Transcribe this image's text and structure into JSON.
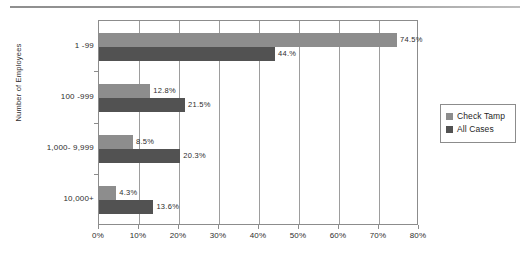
{
  "chart_data": {
    "type": "bar",
    "orientation": "horizontal",
    "title": "",
    "xlabel": "",
    "ylabel": "Number of Employees",
    "categories": [
      "1 -99",
      "100 -999",
      "1,000- 9,999",
      "10,000+"
    ],
    "series": [
      {
        "name": "Check Tamp",
        "color": "#8d8d8d",
        "values": [
          74.5,
          12.8,
          8.5,
          4.3
        ],
        "labels": [
          "74.5%",
          "12.8%",
          "8.5%",
          "4.3%"
        ]
      },
      {
        "name": "All Cases",
        "color": "#525252",
        "values": [
          44.0,
          21.5,
          20.3,
          13.6
        ],
        "labels": [
          "44.%",
          "21.5%",
          "20.3%",
          "13.6%"
        ]
      }
    ],
    "xlim": [
      0,
      80
    ],
    "xtick_values": [
      0,
      10,
      20,
      30,
      40,
      50,
      60,
      70,
      80
    ],
    "xtick_labels": [
      "0%",
      "10%",
      "20%",
      "30%",
      "40%",
      "50%",
      "60%",
      "70%",
      "80%"
    ],
    "grid": "vertical",
    "legend_position": "right"
  },
  "legend": {
    "items": [
      {
        "label": "Check Tamp",
        "swatch_name": "legend-swatch-check-tamp"
      },
      {
        "label": "All Cases",
        "swatch_name": "legend-swatch-all-cases"
      }
    ]
  }
}
